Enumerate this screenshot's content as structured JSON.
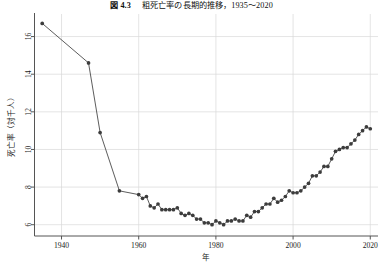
{
  "figure": {
    "title_prefix": "図 4.3",
    "title_text": "粗死亡率の長期的推移，1935〜2020",
    "title_full": "図 4.3　粗死亡率の長期的推移，1935〜2020"
  },
  "chart_data": {
    "type": "line",
    "xlabel": "年",
    "ylabel": "死亡率（対千人）",
    "xlim": [
      1933,
      2022
    ],
    "ylim": [
      5.4,
      17.2
    ],
    "xticks": [
      1940,
      1960,
      1980,
      2000,
      2020
    ],
    "yticks": [
      6,
      8,
      10,
      12,
      14,
      16
    ],
    "grid": "horizontal-and-vertical",
    "legend": "none",
    "marker": "filled-circle",
    "marker_color": "#3c3c3c",
    "line_color": "#4a4a4a",
    "grid_color": "#d8d8d8",
    "x": [
      1935,
      1947,
      1950,
      1955,
      1960,
      1961,
      1962,
      1963,
      1964,
      1965,
      1966,
      1967,
      1968,
      1969,
      1970,
      1971,
      1972,
      1973,
      1974,
      1975,
      1976,
      1977,
      1978,
      1979,
      1980,
      1981,
      1982,
      1983,
      1984,
      1985,
      1986,
      1987,
      1988,
      1989,
      1990,
      1991,
      1992,
      1993,
      1994,
      1995,
      1996,
      1997,
      1998,
      1999,
      2000,
      2001,
      2002,
      2003,
      2004,
      2005,
      2006,
      2007,
      2008,
      2009,
      2010,
      2011,
      2012,
      2013,
      2014,
      2015,
      2016,
      2017,
      2018,
      2019,
      2020
    ],
    "y": [
      16.7,
      14.6,
      10.9,
      7.8,
      7.6,
      7.4,
      7.5,
      7.0,
      6.9,
      7.1,
      6.8,
      6.8,
      6.8,
      6.8,
      6.9,
      6.6,
      6.5,
      6.6,
      6.5,
      6.3,
      6.3,
      6.1,
      6.1,
      6.0,
      6.2,
      6.1,
      6.0,
      6.2,
      6.2,
      6.3,
      6.2,
      6.2,
      6.5,
      6.4,
      6.7,
      6.7,
      6.9,
      7.1,
      7.1,
      7.4,
      7.2,
      7.3,
      7.5,
      7.8,
      7.7,
      7.7,
      7.8,
      8.0,
      8.2,
      8.6,
      8.6,
      8.8,
      9.1,
      9.1,
      9.5,
      9.9,
      10.0,
      10.1,
      10.1,
      10.3,
      10.5,
      10.8,
      11.0,
      11.2,
      11.1
    ],
    "series_name": "粗死亡率（人口千対）"
  }
}
